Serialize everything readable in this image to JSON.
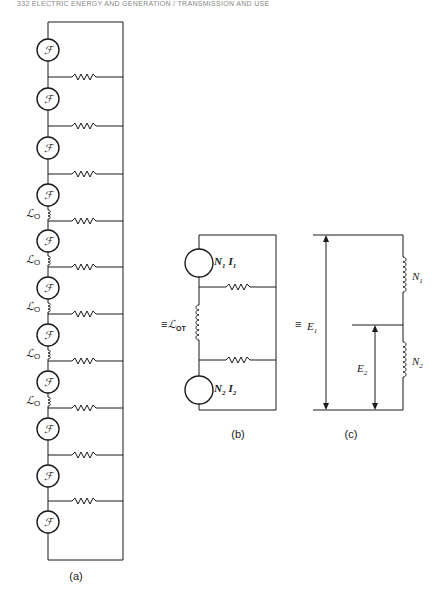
{
  "header": {
    "text": "332 ELECTRIC ENERGY AND GENERATION / TRANSMISSION AND USE"
  },
  "panel_a": {
    "caption": "(a)",
    "generator_symbol": "ℱ",
    "generator_count": 11,
    "resistor_count": 10,
    "inductor_label": "ℒ",
    "inductor_subscript": "O",
    "inductor_count": 5
  },
  "panel_b": {
    "caption": "(b)",
    "equiv_symbol": "≡",
    "gen1": {
      "n": "N",
      "n_sub": "1",
      "i": "I",
      "i_sub": "1"
    },
    "gen2": {
      "n": "N",
      "n_sub": "2",
      "i": "I",
      "i_sub": "2"
    },
    "inductor_label": "ℒ",
    "inductor_subscript": "OT"
  },
  "panel_c": {
    "caption": "(c)",
    "equiv_symbol": "≡",
    "e1": {
      "label": "E",
      "sub": "1"
    },
    "e2": {
      "label": "E",
      "sub": "2"
    },
    "n1": {
      "label": "N",
      "sub": "1"
    },
    "n2": {
      "label": "N",
      "sub": "2"
    }
  }
}
